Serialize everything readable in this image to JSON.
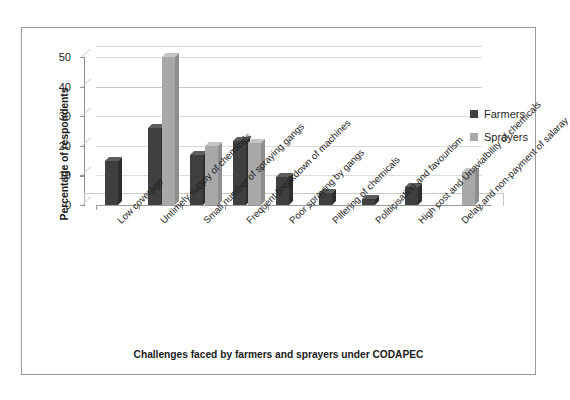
{
  "chart_data": {
    "type": "bar",
    "title": "",
    "subtitle": "",
    "xlabel": "Challenges faced by farmers and sprayers under CODAPEC",
    "ylabel": "Percentage of respondents",
    "ylim": [
      0,
      50
    ],
    "yticks": [
      0,
      10,
      20,
      30,
      40,
      50
    ],
    "ytick_labels": [
      "0",
      "10",
      "20",
      "30",
      "40",
      "50"
    ],
    "grid": "horizontal",
    "legend_position": "right",
    "orientation": "vertical",
    "style": "3d-clustered-column",
    "categories": [
      "Low coverage",
      "Untimely supply of chemicals",
      "Small number of spraying gangs",
      "Frequent breakdown of machines",
      "Poor spraying by gangs",
      "Pilfering of chemicals",
      "Politicisation and favourtism",
      "High cost and Unavialbility of chemicals",
      "Delay and non-payment of salaray"
    ],
    "series": [
      {
        "name": "Farmers",
        "color": "#3f3f3f",
        "values": [
          15,
          26,
          17,
          21.5,
          9.5,
          4,
          2,
          6,
          0
        ]
      },
      {
        "name": "Sprayers",
        "color": "#a8a8a8",
        "values": [
          0,
          50,
          20,
          21,
          0,
          0,
          0,
          0,
          11
        ]
      }
    ]
  },
  "legend": {
    "items": [
      {
        "label": "Farmers",
        "color": "#3f3f3f"
      },
      {
        "label": "Sprayers",
        "color": "#a8a8a8"
      }
    ]
  },
  "axes": {
    "y_title": "Percentage of respondents",
    "x_title": "Challenges faced by farmers and sprayers under CODAPEC"
  }
}
